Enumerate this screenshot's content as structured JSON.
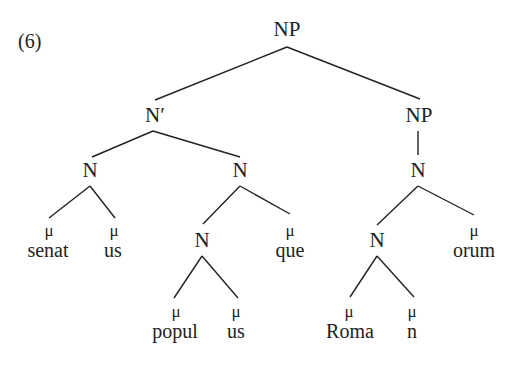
{
  "example_number": "(6)",
  "tree": {
    "root": "NP",
    "n_bar": "N′",
    "np_right": "NP",
    "n_np_right": "N",
    "n_left": "N",
    "n_mid": "N",
    "n_popul": "N",
    "n_roma": "N",
    "mu": "μ",
    "words": {
      "senat": "senat",
      "us1": "us",
      "popul": "popul",
      "us2": "us",
      "que": "que",
      "roma": "Roma",
      "n": "n",
      "orum": "orum"
    }
  },
  "colors": {
    "line": "#222222",
    "text": "#222222",
    "background": "#ffffff"
  }
}
